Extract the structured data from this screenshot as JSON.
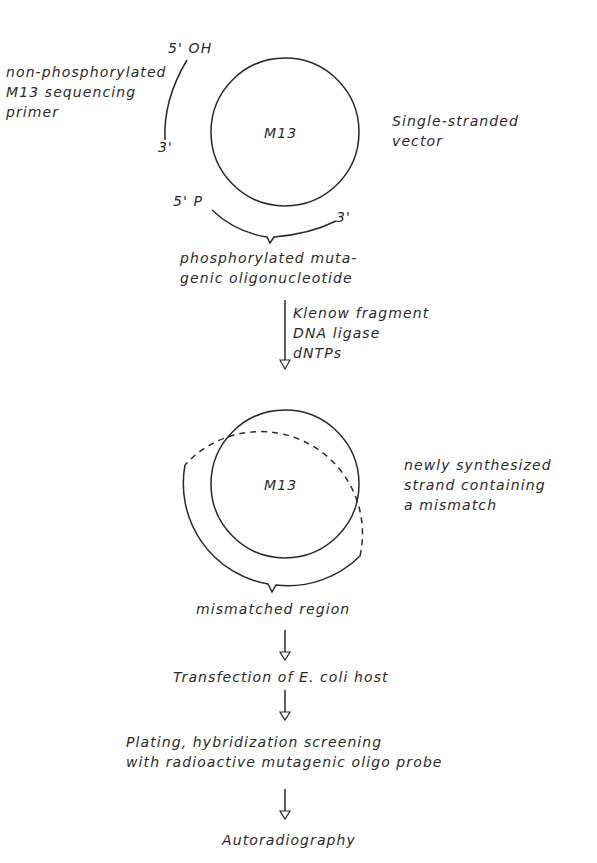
{
  "diagram": {
    "type": "flow-diagram",
    "colors": {
      "ink": "#2a2a2a",
      "background": "#ffffff"
    },
    "step1": {
      "vector_label": "M13",
      "vector_description": [
        "Single-stranded",
        "vector"
      ],
      "primer": {
        "end_5": "5' OH",
        "end_3": "3'",
        "description": [
          "non-phosphorylated",
          "M13 sequencing",
          "primer"
        ]
      },
      "oligo": {
        "end_5": "5' P",
        "end_3": "3'",
        "description": [
          "phosphorylated muta-",
          "genic oligonucleotide"
        ]
      }
    },
    "transition1": {
      "reagents": [
        "Klenow fragment",
        "DNA ligase",
        "dNTPs"
      ]
    },
    "step2": {
      "vector_label": "M13",
      "new_strand_description": [
        "newly synthesized",
        "strand containing",
        "a mismatch"
      ],
      "mismatch_label": "mismatched region"
    },
    "steps": [
      {
        "text": [
          "Transfection of E. coli host"
        ]
      },
      {
        "text": [
          "Plating, hybridization screening",
          "with radioactive mutagenic oligo probe"
        ]
      },
      {
        "text": [
          "Autoradiography"
        ]
      }
    ]
  }
}
